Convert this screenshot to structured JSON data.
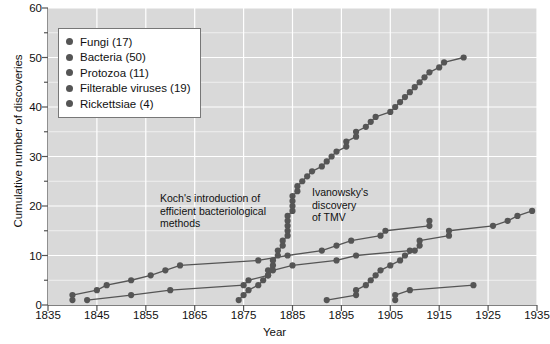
{
  "chart_data": {
    "type": "line",
    "title": "",
    "xlabel": "Year",
    "ylabel": "Cumulative number of discoveries",
    "xlim": [
      1835,
      1935
    ],
    "ylim": [
      0,
      60
    ],
    "xticks": [
      1835,
      1845,
      1855,
      1865,
      1875,
      1885,
      1895,
      1905,
      1915,
      1925,
      1935
    ],
    "yticks": [
      0,
      10,
      20,
      30,
      40,
      50,
      60
    ],
    "y_minor_ticks": [
      5,
      15,
      25,
      35,
      45,
      55
    ],
    "grid": true,
    "legend_position": "upper left",
    "markers": "filled-circle",
    "series": [
      {
        "name": "Fungi (17)",
        "count": 17,
        "color": "#555555",
        "points": [
          [
            1840,
            1
          ],
          [
            1840,
            2
          ],
          [
            1845,
            3
          ],
          [
            1847,
            4
          ],
          [
            1852,
            5
          ],
          [
            1856,
            6
          ],
          [
            1859,
            7
          ],
          [
            1862,
            8
          ],
          [
            1878,
            9
          ],
          [
            1884,
            10
          ],
          [
            1891,
            11
          ],
          [
            1894,
            12
          ],
          [
            1897,
            13
          ],
          [
            1903,
            14
          ],
          [
            1904,
            15
          ],
          [
            1913,
            16
          ],
          [
            1913,
            17
          ]
        ]
      },
      {
        "name": "Bacteria (50)",
        "count": 50,
        "color": "#555555",
        "points": [
          [
            1874,
            1
          ],
          [
            1875,
            2
          ],
          [
            1876,
            3
          ],
          [
            1878,
            4
          ],
          [
            1879,
            5
          ],
          [
            1880,
            6
          ],
          [
            1880,
            7
          ],
          [
            1881,
            8
          ],
          [
            1881,
            9
          ],
          [
            1882,
            10
          ],
          [
            1882,
            11
          ],
          [
            1883,
            12
          ],
          [
            1883,
            13
          ],
          [
            1884,
            14
          ],
          [
            1884,
            15
          ],
          [
            1884,
            16
          ],
          [
            1884,
            17
          ],
          [
            1884,
            18
          ],
          [
            1885,
            19
          ],
          [
            1885,
            20
          ],
          [
            1885,
            21
          ],
          [
            1885,
            22
          ],
          [
            1886,
            23
          ],
          [
            1886,
            24
          ],
          [
            1887,
            25
          ],
          [
            1888,
            26
          ],
          [
            1889,
            27
          ],
          [
            1891,
            28
          ],
          [
            1892,
            29
          ],
          [
            1893,
            30
          ],
          [
            1894,
            31
          ],
          [
            1896,
            32
          ],
          [
            1896,
            33
          ],
          [
            1898,
            34
          ],
          [
            1898,
            35
          ],
          [
            1900,
            36
          ],
          [
            1901,
            37
          ],
          [
            1902,
            38
          ],
          [
            1905,
            39
          ],
          [
            1906,
            40
          ],
          [
            1907,
            41
          ],
          [
            1908,
            42
          ],
          [
            1909,
            43
          ],
          [
            1910,
            44
          ],
          [
            1911,
            45
          ],
          [
            1912,
            46
          ],
          [
            1913,
            47
          ],
          [
            1915,
            48
          ],
          [
            1916,
            49
          ],
          [
            1920,
            50
          ]
        ]
      },
      {
        "name": "Protozoa (11)",
        "count": 11,
        "color": "#555555",
        "points": [
          [
            1843,
            1
          ],
          [
            1852,
            2
          ],
          [
            1860,
            3
          ],
          [
            1875,
            4
          ],
          [
            1876,
            5
          ],
          [
            1880,
            6
          ],
          [
            1881,
            7
          ],
          [
            1885,
            8
          ],
          [
            1894,
            9
          ],
          [
            1898,
            10
          ],
          [
            1909,
            11
          ]
        ]
      },
      {
        "name": "Filterable viruses (19)",
        "count": 19,
        "color": "#555555",
        "points": [
          [
            1892,
            1
          ],
          [
            1898,
            2
          ],
          [
            1898,
            3
          ],
          [
            1900,
            4
          ],
          [
            1901,
            5
          ],
          [
            1902,
            6
          ],
          [
            1903,
            7
          ],
          [
            1905,
            8
          ],
          [
            1907,
            9
          ],
          [
            1908,
            10
          ],
          [
            1910,
            11
          ],
          [
            1911,
            12
          ],
          [
            1911,
            13
          ],
          [
            1917,
            14
          ],
          [
            1917,
            15
          ],
          [
            1926,
            16
          ],
          [
            1929,
            17
          ],
          [
            1931,
            18
          ],
          [
            1934,
            19
          ]
        ]
      },
      {
        "name": "Rickettsiae (4)",
        "count": 4,
        "color": "#555555",
        "points": [
          [
            1906,
            1
          ],
          [
            1906,
            2
          ],
          [
            1909,
            3
          ],
          [
            1922,
            4
          ]
        ]
      }
    ],
    "annotations": [
      {
        "id": "koch",
        "lines": [
          "Koch's introduction of",
          "efficient bacteriological",
          "methods"
        ],
        "arrow_target_year": 1881,
        "arrow_target_value": 8
      },
      {
        "id": "ivanowsky",
        "lines": [
          "Ivanowsky's",
          "discovery",
          "of TMV"
        ],
        "arrow_target_year": 1892,
        "arrow_target_value": 1
      }
    ]
  },
  "legend": {
    "items": [
      {
        "label": "Fungi (17)"
      },
      {
        "label": "Bacteria (50)"
      },
      {
        "label": "Protozoa (11)"
      },
      {
        "label": "Filterable viruses (19)"
      },
      {
        "label": "Rickettsiae (4)"
      }
    ]
  },
  "colors": {
    "plot_background": "#d9d9d9",
    "gridline": "#ffffff",
    "marker": "#555555",
    "line": "#555555",
    "axis": "#555555",
    "text": "#111111"
  }
}
